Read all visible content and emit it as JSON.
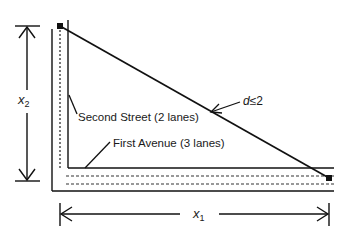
{
  "diagram": {
    "labels": {
      "second_street": "Second Street (2 lanes)",
      "first_avenue": "First Avenue (3 lanes)",
      "distance_var": "d",
      "distance_cond": "≤2",
      "x1_var": "x",
      "x1_sub": "1",
      "x2_var": "x",
      "x2_sub": "2"
    },
    "colors": {
      "line": "#111111",
      "dashed": "#333333",
      "background": "#ffffff"
    }
  }
}
